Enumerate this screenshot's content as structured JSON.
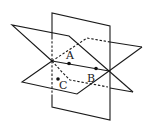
{
  "figure": {
    "labels": {
      "A": "A",
      "B": "B",
      "C": "C"
    },
    "colors": {
      "stroke": "#1a1a1a",
      "background": "#ffffff"
    }
  }
}
